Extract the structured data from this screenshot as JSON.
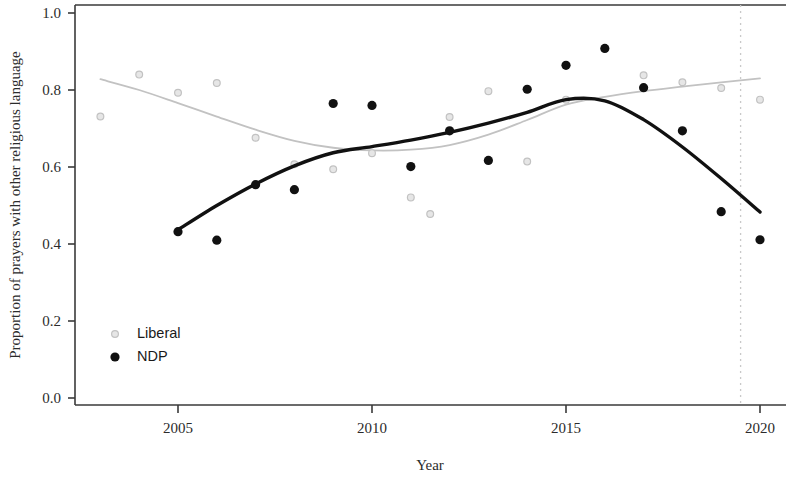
{
  "chart_data": {
    "type": "scatter",
    "title": "",
    "xlabel": "Year",
    "ylabel": "Proportion of prayers with other religious language",
    "xlim": [
      2002.3,
      2020.6
    ],
    "ylim": [
      0.0,
      1.04
    ],
    "grid": false,
    "legend_position": "bottom-left",
    "xticks": [
      2005,
      2010,
      2015,
      2020
    ],
    "xtick_labels": [
      "2005",
      "2010",
      "2015",
      "2020"
    ],
    "yticks": [
      0.0,
      0.2,
      0.4,
      0.6,
      0.8,
      1.0
    ],
    "ytick_labels": [
      "0.0",
      "0.2",
      "0.4",
      "0.6",
      "0.8",
      "1.0"
    ],
    "annotations": [
      {
        "name": "vertical-reference-line",
        "type": "vline",
        "x": 2019.5,
        "style": "dotted",
        "color": "#c9c9c9"
      }
    ],
    "series": [
      {
        "name": "Liberal",
        "color": "#c2c2c2",
        "marker": "circle-open",
        "points": [
          {
            "x": 2003,
            "y": 0.731
          },
          {
            "x": 2004,
            "y": 0.84
          },
          {
            "x": 2005,
            "y": 0.793
          },
          {
            "x": 2006,
            "y": 0.818
          },
          {
            "x": 2007,
            "y": 0.676
          },
          {
            "x": 2008,
            "y": 0.607
          },
          {
            "x": 2009,
            "y": 0.594
          },
          {
            "x": 2010,
            "y": 0.636
          },
          {
            "x": 2011,
            "y": 0.521
          },
          {
            "x": 2011.5,
            "y": 0.478
          },
          {
            "x": 2012,
            "y": 0.73
          },
          {
            "x": 2013,
            "y": 0.797
          },
          {
            "x": 2014,
            "y": 0.614
          },
          {
            "x": 2015,
            "y": 0.775
          },
          {
            "x": 2016,
            "y": 0.908
          },
          {
            "x": 2017,
            "y": 0.838
          },
          {
            "x": 2018,
            "y": 0.82
          },
          {
            "x": 2019,
            "y": 0.805
          },
          {
            "x": 2020,
            "y": 0.775
          }
        ],
        "trend": [
          {
            "x": 2003,
            "y": 0.828
          },
          {
            "x": 2004,
            "y": 0.8
          },
          {
            "x": 2005,
            "y": 0.766
          },
          {
            "x": 2006,
            "y": 0.731
          },
          {
            "x": 2007,
            "y": 0.697
          },
          {
            "x": 2008,
            "y": 0.668
          },
          {
            "x": 2009,
            "y": 0.65
          },
          {
            "x": 2010,
            "y": 0.643
          },
          {
            "x": 2011,
            "y": 0.645
          },
          {
            "x": 2012,
            "y": 0.657
          },
          {
            "x": 2013,
            "y": 0.684
          },
          {
            "x": 2014,
            "y": 0.722
          },
          {
            "x": 2015,
            "y": 0.762
          },
          {
            "x": 2016,
            "y": 0.782
          },
          {
            "x": 2017,
            "y": 0.797
          },
          {
            "x": 2018,
            "y": 0.809
          },
          {
            "x": 2019,
            "y": 0.82
          },
          {
            "x": 2020,
            "y": 0.83
          }
        ]
      },
      {
        "name": "NDP",
        "color": "#111111",
        "marker": "circle-filled",
        "points": [
          {
            "x": 2005,
            "y": 0.432
          },
          {
            "x": 2006,
            "y": 0.41
          },
          {
            "x": 2007,
            "y": 0.554
          },
          {
            "x": 2008,
            "y": 0.541
          },
          {
            "x": 2009,
            "y": 0.765
          },
          {
            "x": 2010,
            "y": 0.76
          },
          {
            "x": 2011,
            "y": 0.601
          },
          {
            "x": 2012,
            "y": 0.694
          },
          {
            "x": 2013,
            "y": 0.617
          },
          {
            "x": 2014,
            "y": 0.802
          },
          {
            "x": 2015,
            "y": 0.864
          },
          {
            "x": 2016,
            "y": 0.908
          },
          {
            "x": 2017,
            "y": 0.806
          },
          {
            "x": 2018,
            "y": 0.694
          },
          {
            "x": 2019,
            "y": 0.484
          },
          {
            "x": 2020,
            "y": 0.411
          }
        ],
        "trend": [
          {
            "x": 2005,
            "y": 0.437
          },
          {
            "x": 2006,
            "y": 0.5
          },
          {
            "x": 2007,
            "y": 0.556
          },
          {
            "x": 2008,
            "y": 0.603
          },
          {
            "x": 2009,
            "y": 0.637
          },
          {
            "x": 2010,
            "y": 0.653
          },
          {
            "x": 2011,
            "y": 0.67
          },
          {
            "x": 2012,
            "y": 0.69
          },
          {
            "x": 2013,
            "y": 0.714
          },
          {
            "x": 2014,
            "y": 0.742
          },
          {
            "x": 2015,
            "y": 0.775
          },
          {
            "x": 2016,
            "y": 0.772
          },
          {
            "x": 2017,
            "y": 0.723
          },
          {
            "x": 2018,
            "y": 0.652
          },
          {
            "x": 2019,
            "y": 0.57
          },
          {
            "x": 2020,
            "y": 0.483
          }
        ]
      }
    ],
    "legend": [
      {
        "label": "Liberal",
        "color": "#c2c2c2",
        "marker": "circle-open"
      },
      {
        "label": "NDP",
        "color": "#111111",
        "marker": "circle-filled"
      }
    ]
  }
}
